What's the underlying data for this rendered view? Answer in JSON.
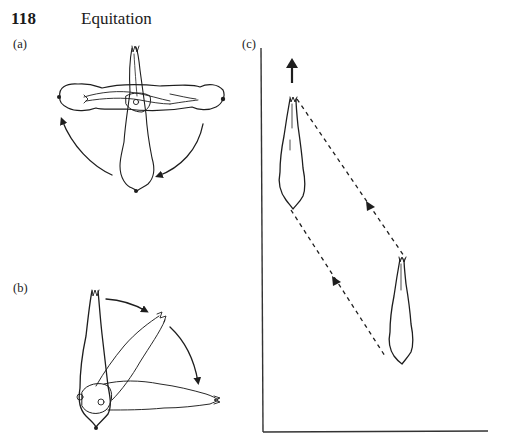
{
  "header": {
    "page_number": "118",
    "running_head": "Equitation"
  },
  "figure": {
    "panels": [
      {
        "id": "a",
        "label": "(a)",
        "description": "Horse shown from above pivoting about its centre: forehand and hindquarters swing in opposite directions (turn on the centre), curved arrows indicate rotation"
      },
      {
        "id": "b",
        "label": "(b)",
        "description": "Horse shown from above pivoting around its hindquarters (turn on the haunches), curved arrows show forehand moving through 90 degrees"
      },
      {
        "id": "c",
        "label": "(c)",
        "description": "Horse moving forward and sideways (half-pass/leg-yield) between two positions, dashed parallel lines with arrowheads indicate lateral movement path; up arrow indicates forward direction; L-shaped frame represents arena walls"
      }
    ],
    "icons": {
      "forward_arrow": "arrow-up-icon",
      "direction_markers": "triangle-arrowhead-icon"
    },
    "colors": {
      "ink": "#1e1e1e",
      "paper": "#ffffff"
    }
  }
}
